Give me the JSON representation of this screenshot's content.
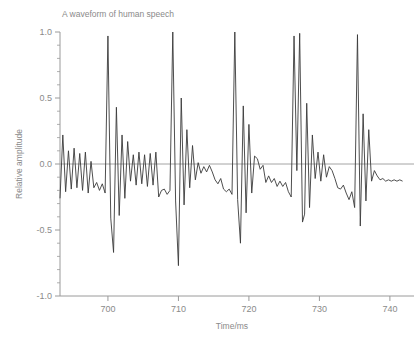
{
  "chart_data": {
    "type": "line",
    "title": "A waveform of human speech",
    "xlabel": "Time/ms",
    "ylabel": "Relative amplitude",
    "xlim": [
      693.2,
      742.0
    ],
    "ylim": [
      -1.0,
      1.0
    ],
    "grid": false,
    "legend": null,
    "xticks": [
      700,
      710,
      720,
      730,
      740
    ],
    "xticklabels": [
      "700",
      "710",
      "720",
      "730",
      "740"
    ],
    "yticks": [
      -1.0,
      -0.5,
      0.0,
      0.5,
      1.0
    ],
    "yticklabels": [
      "-1.0",
      "-0.5",
      "0.0",
      "0.5",
      "1.0"
    ],
    "yminorticks": [
      -0.9,
      -0.8,
      -0.7,
      -0.6,
      -0.4,
      -0.3,
      -0.2,
      -0.1,
      0.1,
      0.2,
      0.3,
      0.4,
      0.6,
      0.7,
      0.8,
      0.9
    ],
    "zero_line": 0.0,
    "line_color": "#3a3a3a",
    "axis_color": "#9a9a9a",
    "series": [
      {
        "name": "human speech waveform",
        "x": [
          693.2,
          693.6,
          694.0,
          694.4,
          694.8,
          695.2,
          695.6,
          696.0,
          696.4,
          696.8,
          697.2,
          697.6,
          698.0,
          698.4,
          698.8,
          699.2,
          699.6,
          700.0,
          700.4,
          700.8,
          701.2,
          701.6,
          702.0,
          702.4,
          702.8,
          703.2,
          703.6,
          704.0,
          704.4,
          704.8,
          705.2,
          705.6,
          706.0,
          706.4,
          706.8,
          707.2,
          707.6,
          708.0,
          708.4,
          708.8,
          709.2,
          709.6,
          710.0,
          710.4,
          710.8,
          711.2,
          711.6,
          712.0,
          712.4,
          712.8,
          713.2,
          713.6,
          714.0,
          714.4,
          714.8,
          715.2,
          715.6,
          716.0,
          716.4,
          716.8,
          717.2,
          717.6,
          718.0,
          718.4,
          718.8,
          719.2,
          719.6,
          720.0,
          720.4,
          720.8,
          721.2,
          721.6,
          722.0,
          722.4,
          722.8,
          723.2,
          723.6,
          724.0,
          724.4,
          724.8,
          725.2,
          725.6,
          726.0,
          726.4,
          726.8,
          727.2,
          727.6,
          727.9,
          728.2,
          728.6,
          729.0,
          729.4,
          729.8,
          730.2,
          730.6,
          731.0,
          731.4,
          731.8,
          732.2,
          732.6,
          733.0,
          733.4,
          733.8,
          734.2,
          734.6,
          735.0,
          735.4,
          735.8,
          736.2,
          736.6,
          737.0,
          737.4,
          737.8,
          738.2,
          738.6,
          739.0,
          739.4,
          739.8,
          740.2,
          740.6,
          741.0,
          741.4,
          741.8
        ],
        "y": [
          -0.26,
          0.22,
          -0.21,
          0.1,
          -0.19,
          0.12,
          -0.18,
          0.08,
          -0.2,
          0.09,
          -0.22,
          0.02,
          -0.18,
          -0.14,
          -0.2,
          -0.15,
          -0.22,
          0.97,
          -0.41,
          -0.67,
          0.43,
          -0.39,
          0.22,
          -0.26,
          0.17,
          -0.13,
          0.07,
          -0.16,
          0.09,
          -0.15,
          0.07,
          -0.17,
          0.08,
          -0.16,
          0.09,
          -0.25,
          -0.2,
          -0.19,
          -0.23,
          -0.2,
          1.0,
          -0.28,
          -0.77,
          0.5,
          -0.31,
          0.26,
          -0.18,
          0.14,
          -0.12,
          0.01,
          -0.07,
          -0.02,
          -0.06,
          -0.01,
          -0.06,
          -0.12,
          -0.15,
          -0.11,
          -0.19,
          -0.21,
          -0.19,
          -0.23,
          1.0,
          -0.27,
          -0.6,
          0.44,
          -0.37,
          0.3,
          -0.22,
          0.06,
          0.04,
          -0.04,
          -0.01,
          -0.14,
          -0.09,
          -0.14,
          -0.11,
          -0.17,
          -0.13,
          -0.17,
          -0.14,
          -0.21,
          -0.25,
          0.97,
          -0.05,
          0.99,
          -0.44,
          -0.38,
          0.46,
          -0.33,
          0.22,
          -0.11,
          0.09,
          -0.13,
          0.07,
          -0.1,
          -0.02,
          -0.05,
          -0.11,
          -0.18,
          -0.19,
          -0.16,
          -0.22,
          -0.27,
          -0.21,
          -0.33,
          0.98,
          -0.47,
          0.38,
          -0.28,
          0.26,
          -0.13,
          -0.05,
          -0.09,
          -0.12,
          -0.11,
          -0.13,
          -0.12,
          -0.13,
          -0.12,
          -0.13,
          -0.12,
          -0.13
        ]
      }
    ]
  },
  "figure": {
    "title": "A waveform of human speech",
    "xlabel": "Time/ms",
    "ylabel": "Relative amplitude"
  }
}
